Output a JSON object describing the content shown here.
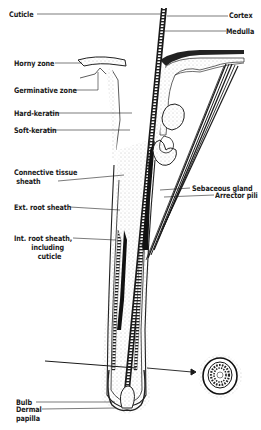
{
  "figure": {
    "type": "anatomical-diagram"
  },
  "labels": {
    "left": [
      {
        "id": "cuticle",
        "text": "Cuticle"
      },
      {
        "id": "horny_zone",
        "text": "Horny zone"
      },
      {
        "id": "germinative_zone",
        "text": "Germinative zone"
      },
      {
        "id": "hard_keratin",
        "text": "Hard-keratin"
      },
      {
        "id": "soft_keratin",
        "text": "Soft-keratin"
      },
      {
        "id": "connective_tissue_sheath",
        "text": "Connective tissue\n sheath"
      },
      {
        "id": "ext_root_sheath",
        "text": "Ext. root sheath"
      },
      {
        "id": "int_root_sheath",
        "text": "Int. root sheath,\n        including\n           cuticle"
      },
      {
        "id": "bulb",
        "text": "Bulb"
      },
      {
        "id": "dermal_papilla",
        "text": "Dermal\npapilla"
      }
    ],
    "right": [
      {
        "id": "cortex",
        "text": "Cortex"
      },
      {
        "id": "medulla",
        "text": "Medulla"
      },
      {
        "id": "sebaceous_gland",
        "text": "Sebaceous gland"
      },
      {
        "id": "arrector_pili",
        "text": "Arrector pili"
      }
    ]
  },
  "colors": {
    "ink": "#1a1a1a",
    "stipple": "#9a9a9a",
    "background": "#ffffff"
  }
}
